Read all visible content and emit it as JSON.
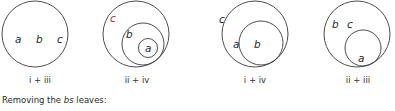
{
  "diagrams": [
    {
      "label": "i + iii",
      "letters": [
        "a",
        "b",
        "c"
      ]
    },
    {
      "label": "ii + iv",
      "letters": [
        "c",
        "b",
        "a"
      ],
      "highlight_color": "#b03030"
    },
    {
      "label": "i + iv",
      "letters": [
        "c",
        "a",
        "b"
      ]
    },
    {
      "label": "ii + iii",
      "letters": [
        "b",
        "c",
        "a"
      ]
    }
  ],
  "caption": {
    "prefix": "Removing the ",
    "emphasis": "bs",
    "suffix": " leaves:"
  }
}
